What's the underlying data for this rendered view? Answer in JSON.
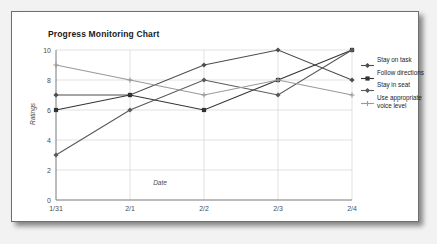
{
  "card": {
    "background": "#ffffff",
    "border_color": "#6e6e6e"
  },
  "chart_data": {
    "type": "line",
    "title": "Progress Monitoring Chart",
    "xlabel": "Date",
    "ylabel": "Ratings",
    "categories": [
      "1/31",
      "2/1",
      "2/2",
      "2/3",
      "2/4"
    ],
    "ylim": [
      0,
      10
    ],
    "yticks": [
      0,
      2,
      4,
      6,
      8,
      10
    ],
    "grid": true,
    "legend_position": "right",
    "series": [
      {
        "name": "Stay on task",
        "values": [
          7,
          7,
          9,
          10,
          8
        ],
        "color": "#4d4d4d",
        "marker": "diamond"
      },
      {
        "name": "Follow directions",
        "values": [
          6,
          7,
          6,
          8,
          10
        ],
        "color": "#333333",
        "marker": "square"
      },
      {
        "name": "Stay in seat",
        "values": [
          3,
          6,
          8,
          7,
          10
        ],
        "color": "#595959",
        "marker": "diamond"
      },
      {
        "name": "Use appropriate voice level",
        "values": [
          9,
          8,
          7,
          8,
          7
        ],
        "color": "#999999",
        "marker": "plus"
      }
    ]
  },
  "legend": {
    "items": [
      {
        "label": "Stay on task"
      },
      {
        "label": "Follow directions"
      },
      {
        "label": "Stay in seat"
      },
      {
        "label": "Use appropriate voice level"
      }
    ]
  }
}
